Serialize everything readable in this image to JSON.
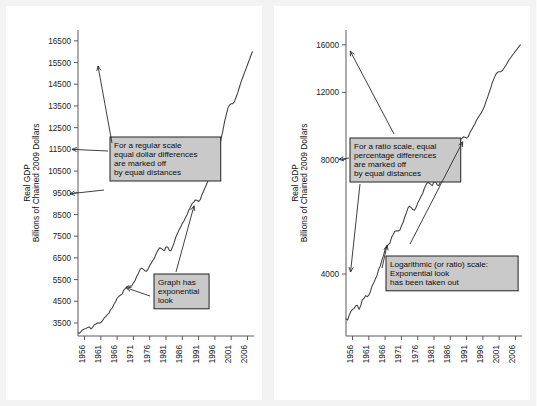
{
  "figure": {
    "background": "#f3f3f3",
    "panel_background": "#ffffff",
    "line_color": "#404040",
    "annotation_fill": "#c9c9c9",
    "annotation_border": "#222222"
  },
  "left_panel": {
    "name": "regular-scale-panel",
    "y_axis_title_line1": "Real GDP",
    "y_axis_title_line2": "Billions of Chained 2009 Dollars",
    "annotations": [
      {
        "id": "regular-scale-note",
        "lines": [
          "For a regular scale",
          "equal dollar differences",
          "are marked off",
          "by equal distances"
        ]
      },
      {
        "id": "exponential-look-note",
        "lines": [
          "Graph has",
          "exponential",
          "look"
        ]
      }
    ]
  },
  "right_panel": {
    "name": "ratio-scale-panel",
    "y_axis_title_line1": "Real GDP",
    "y_axis_title_line2": "Billions of Chained 2009 Dollars",
    "annotations": [
      {
        "id": "ratio-scale-note",
        "lines": [
          "For a ratio scale, equal",
          "percentage differences",
          "are marked off",
          "by equal distances"
        ]
      },
      {
        "id": "log-scale-note",
        "lines": [
          "Logarithmic (or ratio) scale:",
          "Exponential look",
          "has been taken out"
        ]
      }
    ]
  },
  "chart_data": [
    {
      "type": "line",
      "id": "real-gdp-linear",
      "title": "",
      "xlabel": "",
      "ylabel": "Real GDP Billions of Chained 2009 Dollars",
      "scale": "linear",
      "grid": false,
      "legend": "none",
      "xlim": [
        1954.0,
        2008.0
      ],
      "ylim": [
        2900,
        17000
      ],
      "xticks": [
        1956,
        1961,
        1966,
        1971,
        1976,
        1981,
        1986,
        1991,
        1996,
        2001,
        2006
      ],
      "xticklabels": [
        "1956",
        "1961",
        "1966",
        "1971",
        "1976",
        "1981",
        "1986",
        "1991",
        "1996",
        "2001",
        "2006"
      ],
      "yticks": [
        3500,
        4500,
        5500,
        6500,
        7500,
        8500,
        9500,
        10500,
        11500,
        12500,
        13500,
        14500,
        15500,
        16500
      ],
      "yticklabels": [
        "3500",
        "4500",
        "5500",
        "6500",
        "7500",
        "8500",
        "9500",
        "10500",
        "11500",
        "12500",
        "13500",
        "14500",
        "15500",
        "16500"
      ],
      "x": [
        1954.0,
        1954.5,
        1955.0,
        1955.5,
        1956.0,
        1956.5,
        1957.0,
        1957.5,
        1958.0,
        1958.5,
        1959.0,
        1959.5,
        1960.0,
        1960.5,
        1961.0,
        1961.5,
        1962.0,
        1962.5,
        1963.0,
        1963.5,
        1964.0,
        1964.5,
        1965.0,
        1965.5,
        1966.0,
        1966.5,
        1967.0,
        1967.5,
        1968.0,
        1968.5,
        1969.0,
        1969.5,
        1970.0,
        1970.5,
        1971.0,
        1971.5,
        1972.0,
        1972.5,
        1973.0,
        1973.5,
        1974.0,
        1974.5,
        1975.0,
        1975.5,
        1976.0,
        1976.5,
        1977.0,
        1977.5,
        1978.0,
        1978.5,
        1979.0,
        1979.5,
        1980.0,
        1980.5,
        1981.0,
        1981.5,
        1982.0,
        1982.5,
        1983.0,
        1983.5,
        1984.0,
        1984.5,
        1985.0,
        1985.5,
        1986.0,
        1986.5,
        1987.0,
        1987.5,
        1988.0,
        1988.5,
        1989.0,
        1989.5,
        1990.0,
        1990.5,
        1991.0,
        1991.5,
        1992.0,
        1992.5,
        1993.0,
        1993.5,
        1994.0,
        1994.5,
        1995.0,
        1995.5,
        1996.0,
        1996.5,
        1997.0,
        1997.5,
        1998.0,
        1998.5,
        1999.0,
        1999.5,
        2000.0,
        2000.5,
        2001.0,
        2001.5,
        2002.0,
        2002.5,
        2003.0,
        2003.5,
        2004.0,
        2004.5,
        2005.0,
        2005.5,
        2006.0,
        2006.5,
        2007.0,
        2007.5
      ],
      "y": [
        3050,
        3030,
        3120,
        3190,
        3230,
        3250,
        3300,
        3310,
        3230,
        3300,
        3420,
        3450,
        3510,
        3490,
        3520,
        3600,
        3720,
        3790,
        3880,
        3960,
        4110,
        4190,
        4350,
        4470,
        4640,
        4720,
        4780,
        4830,
        5000,
        5080,
        5180,
        5200,
        5190,
        5210,
        5350,
        5460,
        5640,
        5780,
        5960,
        6030,
        5980,
        5910,
        5880,
        5980,
        6150,
        6260,
        6390,
        6500,
        6700,
        6840,
        6960,
        6940,
        6880,
        6830,
        7000,
        7000,
        6850,
        6830,
        7000,
        7200,
        7450,
        7620,
        7790,
        7920,
        8090,
        8200,
        8360,
        8500,
        8700,
        8830,
        9000,
        9070,
        9170,
        9150,
        9100,
        9180,
        9400,
        9560,
        9740,
        9900,
        10120,
        10300,
        10450,
        10600,
        10800,
        11050,
        11380,
        11700,
        12050,
        12400,
        12800,
        13100,
        13400,
        13550,
        13600,
        13600,
        13700,
        13900,
        14100,
        14350,
        14600,
        14800,
        15000,
        15200,
        15400,
        15600,
        15800,
        16000
      ]
    },
    {
      "type": "line",
      "id": "real-gdp-log",
      "title": "",
      "xlabel": "",
      "ylabel": "Real GDP Billions of Chained 2009 Dollars",
      "scale": "log",
      "grid": false,
      "legend": "none",
      "xlim": [
        1954.0,
        2008.0
      ],
      "ylim": [
        2750,
        17500
      ],
      "xticks": [
        1956,
        1961,
        1966,
        1971,
        1976,
        1981,
        1986,
        1991,
        1996,
        2001,
        2006
      ],
      "xticklabels": [
        "1956",
        "1961",
        "1966",
        "1971",
        "1976",
        "1981",
        "1986",
        "1991",
        "1996",
        "2001",
        "2006"
      ],
      "yticks": [
        4000,
        8000,
        12000,
        16000
      ],
      "yticklabels": [
        "4000",
        "8000",
        "12000",
        "16000"
      ],
      "x": [
        1954.0,
        1954.5,
        1955.0,
        1955.5,
        1956.0,
        1956.5,
        1957.0,
        1957.5,
        1958.0,
        1958.5,
        1959.0,
        1959.5,
        1960.0,
        1960.5,
        1961.0,
        1961.5,
        1962.0,
        1962.5,
        1963.0,
        1963.5,
        1964.0,
        1964.5,
        1965.0,
        1965.5,
        1966.0,
        1966.5,
        1967.0,
        1967.5,
        1968.0,
        1968.5,
        1969.0,
        1969.5,
        1970.0,
        1970.5,
        1971.0,
        1971.5,
        1972.0,
        1972.5,
        1973.0,
        1973.5,
        1974.0,
        1974.5,
        1975.0,
        1975.5,
        1976.0,
        1976.5,
        1977.0,
        1977.5,
        1978.0,
        1978.5,
        1979.0,
        1979.5,
        1980.0,
        1980.5,
        1981.0,
        1981.5,
        1982.0,
        1982.5,
        1983.0,
        1983.5,
        1984.0,
        1984.5,
        1985.0,
        1985.5,
        1986.0,
        1986.5,
        1987.0,
        1987.5,
        1988.0,
        1988.5,
        1989.0,
        1989.5,
        1990.0,
        1990.5,
        1991.0,
        1991.5,
        1992.0,
        1992.5,
        1993.0,
        1993.5,
        1994.0,
        1994.5,
        1995.0,
        1995.5,
        1996.0,
        1996.5,
        1997.0,
        1997.5,
        1998.0,
        1998.5,
        1999.0,
        1999.5,
        2000.0,
        2000.5,
        2001.0,
        2001.5,
        2002.0,
        2002.5,
        2003.0,
        2003.5,
        2004.0,
        2004.5,
        2005.0,
        2005.5,
        2006.0,
        2006.5,
        2007.0,
        2007.5
      ],
      "y": [
        3050,
        3030,
        3120,
        3190,
        3230,
        3250,
        3300,
        3310,
        3230,
        3300,
        3420,
        3450,
        3510,
        3490,
        3520,
        3600,
        3720,
        3790,
        3880,
        3960,
        4110,
        4190,
        4350,
        4470,
        4640,
        4720,
        4780,
        4830,
        5000,
        5080,
        5180,
        5200,
        5190,
        5210,
        5350,
        5460,
        5640,
        5780,
        5960,
        6030,
        5980,
        5910,
        5880,
        5980,
        6150,
        6260,
        6390,
        6500,
        6700,
        6840,
        6960,
        6940,
        6880,
        6830,
        7000,
        7000,
        6850,
        6830,
        7000,
        7200,
        7450,
        7620,
        7790,
        7920,
        8090,
        8200,
        8360,
        8500,
        8700,
        8830,
        9000,
        9070,
        9170,
        9150,
        9100,
        9180,
        9400,
        9560,
        9740,
        9900,
        10120,
        10300,
        10450,
        10600,
        10800,
        11050,
        11380,
        11700,
        12050,
        12400,
        12800,
        13100,
        13400,
        13550,
        13600,
        13600,
        13700,
        13900,
        14100,
        14350,
        14600,
        14800,
        15000,
        15200,
        15400,
        15600,
        15800,
        16000
      ]
    }
  ]
}
